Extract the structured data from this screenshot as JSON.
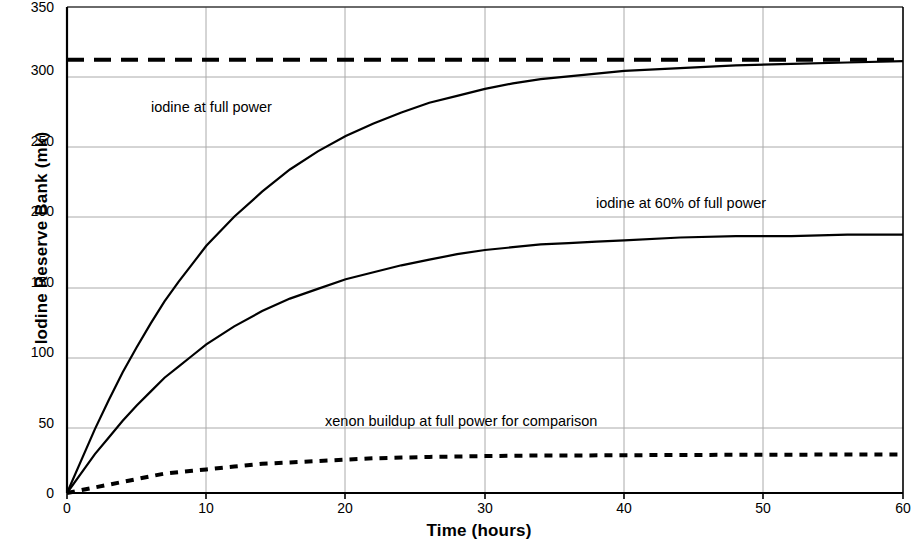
{
  "chart_data": {
    "type": "line",
    "title": "",
    "xlabel": "Time (hours)",
    "ylabel": "Iodine Reserve Bank (mk)",
    "xlim": [
      0,
      60
    ],
    "ylim": [
      0,
      350
    ],
    "xticks": [
      0,
      10,
      20,
      30,
      40,
      50,
      60
    ],
    "yticks": [
      0,
      50,
      100,
      150,
      200,
      250,
      300,
      350
    ],
    "grid": true,
    "legend_position": "inline-annotations",
    "series": [
      {
        "name": "iodine at full power",
        "style": "solid",
        "color": "#000000",
        "x": [
          0,
          1,
          2,
          3,
          4,
          5,
          6,
          7,
          8,
          9,
          10,
          12,
          14,
          16,
          18,
          20,
          22,
          24,
          26,
          28,
          30,
          32,
          34,
          36,
          38,
          40,
          44,
          48,
          52,
          56,
          60
        ],
        "y": [
          0,
          23,
          46,
          67,
          87,
          105,
          122,
          138,
          152,
          165,
          178,
          199,
          217,
          233,
          246,
          257,
          266,
          274,
          281,
          286,
          291,
          295,
          298,
          300,
          302,
          304,
          306,
          308,
          309,
          310,
          311
        ]
      },
      {
        "name": "iodine at 60% of full power",
        "style": "solid",
        "color": "#000000",
        "x": [
          0,
          1,
          2,
          3,
          4,
          5,
          6,
          7,
          8,
          9,
          10,
          12,
          14,
          16,
          18,
          20,
          22,
          24,
          26,
          28,
          30,
          32,
          34,
          36,
          38,
          40,
          44,
          48,
          52,
          56,
          60
        ],
        "y": [
          0,
          14,
          28,
          40,
          52,
          63,
          73,
          83,
          91,
          99,
          107,
          120,
          131,
          140,
          147,
          154,
          159,
          164,
          168,
          172,
          175,
          177,
          179,
          180,
          181,
          182,
          184,
          185,
          185,
          186,
          186
        ]
      },
      {
        "name": "iodine equilibrium at full power",
        "style": "dashed",
        "color": "#000000",
        "x": [
          0,
          60
        ],
        "y": [
          312,
          312
        ]
      },
      {
        "name": "xenon buildup at full power for comparison",
        "style": "dotted",
        "color": "#000000",
        "x": [
          0,
          1,
          2,
          3,
          4,
          5,
          6,
          7,
          8,
          9,
          10,
          12,
          14,
          16,
          18,
          20,
          22,
          24,
          26,
          28,
          30,
          32,
          34,
          36,
          40,
          44,
          48,
          52,
          56,
          60
        ],
        "y": [
          0,
          2,
          4,
          6,
          8,
          10,
          12,
          14,
          15,
          16,
          17,
          19,
          21,
          22,
          23,
          24,
          25,
          25.5,
          26,
          26.3,
          26.6,
          26.8,
          27,
          27,
          27.2,
          27.4,
          27.5,
          27.6,
          27.7,
          27.8
        ]
      }
    ],
    "annotations": [
      {
        "text": "iodine at full power",
        "x": 6.0,
        "y": 278
      },
      {
        "text": "iodine at 60% of full power",
        "x": 38.0,
        "y": 209
      },
      {
        "text": "xenon buildup at full power for comparison",
        "x": 18.5,
        "y": 52
      }
    ]
  },
  "axes": {
    "y_tick_labels": [
      "350",
      "300",
      "250",
      "200",
      "150",
      "100",
      "50",
      "0"
    ],
    "x_tick_labels": [
      "0",
      "10",
      "20",
      "30",
      "40",
      "50",
      "60"
    ]
  }
}
